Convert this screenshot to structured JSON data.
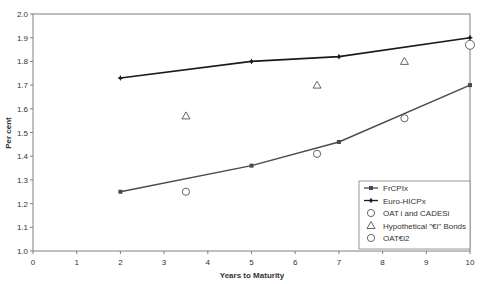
{
  "chart_data": {
    "type": "line",
    "title": "",
    "xlabel": "Years to Maturity",
    "ylabel": "Per cent",
    "xlim": [
      0,
      10
    ],
    "ylim": [
      1.0,
      2.0
    ],
    "x_ticks": [
      "0",
      "1",
      "2",
      "3",
      "4",
      "5",
      "6",
      "7",
      "8",
      "9",
      "10"
    ],
    "y_ticks": [
      "1.0",
      "1.1",
      "1.2",
      "1.3",
      "1.4",
      "1.5",
      "1.6",
      "1.7",
      "1.8",
      "1.9",
      "2.0"
    ],
    "grid": false,
    "legend_position": "lower right (inside plot)",
    "series": [
      {
        "name": "FrCPIx",
        "style": "line-square-marker",
        "color": "#4a4a4a",
        "points": [
          [
            2,
            1.25
          ],
          [
            5,
            1.36
          ],
          [
            7,
            1.46
          ],
          [
            10,
            1.7
          ]
        ]
      },
      {
        "name": "Euro-HICPx",
        "style": "line-plus-marker",
        "color": "#1a1a1a",
        "points": [
          [
            2,
            1.73
          ],
          [
            5,
            1.8
          ],
          [
            7,
            1.82
          ],
          [
            10,
            1.9
          ]
        ]
      },
      {
        "name": "OATi and CADESi",
        "style": "open-circle",
        "color": "#555555",
        "points": [
          [
            3.5,
            1.25
          ],
          [
            6.5,
            1.41
          ],
          [
            8.5,
            1.56
          ]
        ]
      },
      {
        "name": "Hypothetical \"€i\" Bonds",
        "style": "open-triangle",
        "color": "#555555",
        "points": [
          [
            3.5,
            1.57
          ],
          [
            6.5,
            1.7
          ],
          [
            8.5,
            1.8
          ]
        ]
      },
      {
        "name": "OAT€i2",
        "style": "open-circle-large",
        "color": "#555555",
        "points": [
          [
            10,
            1.87
          ]
        ]
      }
    ]
  },
  "legend": {
    "items": [
      {
        "label": "FrCPIx"
      },
      {
        "label": "Euro-HICPx"
      },
      {
        "label": "OAT i and CADESi"
      },
      {
        "label": "Hypothetical \"€i\" Bonds"
      },
      {
        "label": "OAT€i2"
      }
    ]
  },
  "axes": {
    "x_title": "Years to Maturity",
    "y_title": "Per cent"
  }
}
